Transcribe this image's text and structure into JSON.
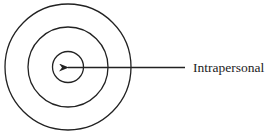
{
  "diagram": {
    "type": "concentric-circles",
    "center": [
      68,
      67
    ],
    "rings": [
      {
        "name": "outer-ring",
        "radius": 63
      },
      {
        "name": "middle-ring",
        "radius": 40
      },
      {
        "name": "inner-ring",
        "radius": 15.5
      }
    ],
    "arrow": {
      "from": [
        185,
        67.5
      ],
      "to": [
        67,
        67.5
      ]
    },
    "label": "Intrapersonal",
    "stroke_color": "#222222"
  }
}
